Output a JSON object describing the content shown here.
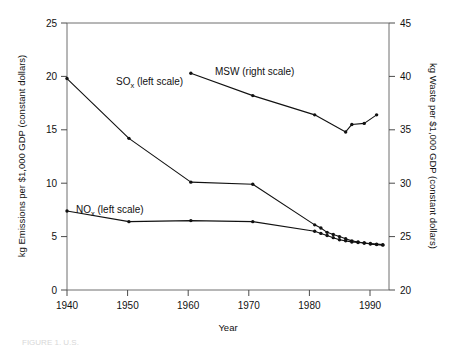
{
  "chart_data": {
    "type": "line",
    "title": "",
    "xlabel": "Year",
    "ylabel": "kg Emissions per $1,000 GDP (constant  dollars)",
    "y2label": "kg Waste per $1,000 GDP (constant dollars)",
    "xlim": [
      1940,
      1992
    ],
    "ylim": [
      0,
      25
    ],
    "y2lim": [
      20,
      45
    ],
    "xticks": [
      1940,
      1950,
      1960,
      1970,
      1980,
      1990
    ],
    "xtick_labels": [
      "1940",
      "1950",
      "1960",
      "1970",
      "1980",
      "1990"
    ],
    "yticks": [
      0,
      5,
      10,
      15,
      20,
      25
    ],
    "ytick_labels": [
      "0",
      "5",
      "10",
      "15",
      "20",
      "25"
    ],
    "y2ticks": [
      20,
      25,
      30,
      35,
      40,
      45
    ],
    "y2tick_labels": [
      "20",
      "25",
      "30",
      "35",
      "40",
      "45"
    ],
    "grid": false,
    "legend_position": "inline-annotations",
    "series": [
      {
        "name": "SOx (left scale)",
        "label_text": "SO",
        "label_sub": "x",
        "label_suffix": " (left scale)",
        "axis": "left",
        "marker": "dot",
        "x": [
          1940,
          1950,
          1960,
          1970,
          1980,
          1981,
          1982,
          1983,
          1984,
          1985,
          1986,
          1987,
          1988,
          1989,
          1990,
          1991
        ],
        "y": [
          19.8,
          14.2,
          10.1,
          9.9,
          6.1,
          5.8,
          5.4,
          5.2,
          5.0,
          4.8,
          4.6,
          4.5,
          4.4,
          4.3,
          4.25,
          4.2
        ]
      },
      {
        "name": "NOx (left scale)",
        "label_text": "NO",
        "label_sub": "x",
        "label_suffix": " (left scale)",
        "axis": "left",
        "marker": "dot",
        "x": [
          1940,
          1950,
          1960,
          1970,
          1980,
          1981,
          1982,
          1983,
          1984,
          1985,
          1986,
          1987,
          1988,
          1989,
          1990,
          1991
        ],
        "y": [
          7.4,
          6.4,
          6.5,
          6.4,
          5.5,
          5.3,
          5.1,
          4.9,
          4.7,
          4.6,
          4.5,
          4.45,
          4.4,
          4.35,
          4.3,
          4.25
        ]
      },
      {
        "name": "MSW (right scale)",
        "label_text": "MSW (right scale)",
        "label_sub": "",
        "label_suffix": "",
        "axis": "right",
        "marker": "dot",
        "x": [
          1960,
          1970,
          1980,
          1985,
          1986,
          1988,
          1990
        ],
        "y": [
          40.3,
          38.2,
          36.4,
          34.8,
          35.5,
          35.6,
          36.4
        ]
      }
    ]
  },
  "annotations": {
    "sox_label_x": 1948.5,
    "sox_label_y": 17.6,
    "nox_label_x": 1941.5,
    "nox_label_y": 8.6,
    "msw_label_x": 1971.5,
    "msw_label_y": 40.9
  },
  "caption": {
    "partial_text": "FIGURE 1.  U.S."
  }
}
